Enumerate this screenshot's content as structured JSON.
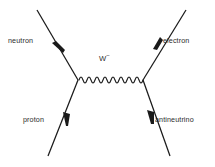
{
  "diagram": {
    "type": "feynman-diagram",
    "process": "beta-minus decay",
    "background_color": "#ffffff",
    "line_color": "#1a1a1a",
    "label_color": "#2b2b2b",
    "width": 215,
    "height": 167,
    "vertices": {
      "left": {
        "x": 78,
        "y": 80
      },
      "right": {
        "x": 143,
        "y": 80
      }
    },
    "labels": {
      "neutron": "neutron",
      "electron": "electron",
      "proton": "proton",
      "antineutrino": "antineutrino",
      "boson": "W",
      "boson_charge": "−"
    },
    "lines": [
      {
        "name": "neutron-line",
        "label": "neutron",
        "from": {
          "x": 37,
          "y": 10
        },
        "to": {
          "x": 78,
          "y": 80
        },
        "arrow": {
          "x": 58,
          "y": 45,
          "direction": "down-right"
        },
        "style": "straight"
      },
      {
        "name": "proton-line",
        "label": "proton",
        "from": {
          "x": 78,
          "y": 80
        },
        "to": {
          "x": 48,
          "y": 156
        },
        "arrow": {
          "x": 67,
          "y": 121,
          "direction": "down-left"
        },
        "style": "straight"
      },
      {
        "name": "electron-line",
        "label": "electron",
        "from": {
          "x": 143,
          "y": 80
        },
        "to": {
          "x": 186,
          "y": 10
        },
        "arrow": {
          "x": 158,
          "y": 42,
          "direction": "up-right"
        },
        "style": "straight"
      },
      {
        "name": "antineutrino-line",
        "label": "antineutrino",
        "from": {
          "x": 143,
          "y": 80
        },
        "to": {
          "x": 170,
          "y": 156
        },
        "arrow": {
          "x": 152,
          "y": 119,
          "direction": "down-right"
        },
        "style": "straight"
      },
      {
        "name": "w-boson-propagator",
        "label": "W−",
        "from": {
          "x": 78,
          "y": 80
        },
        "to": {
          "x": 143,
          "y": 80
        },
        "style": "wavy",
        "oscillations": 8
      }
    ]
  }
}
